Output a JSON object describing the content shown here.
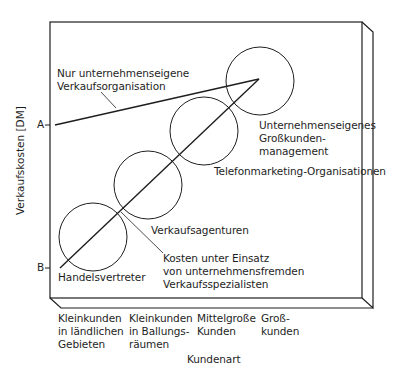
{
  "diagram": {
    "y_axis_label": "Verkaufskosten [DM]",
    "x_axis_label": "Kundenart",
    "y_markers": [
      {
        "label": "A",
        "y": 125
      },
      {
        "label": "B",
        "y": 268
      }
    ],
    "x_categories": [
      {
        "line1": "Kleinkunden",
        "line2": "in ländlichen",
        "line3": "Gebieten"
      },
      {
        "line1": "Kleinkunden",
        "line2": "in Ballungs-",
        "line3": "räumen"
      },
      {
        "line1": "Mittelgroße",
        "line2": "Kunden",
        "line3": ""
      },
      {
        "line1": "Groß-",
        "line2": "kunden",
        "line3": ""
      }
    ],
    "annotations": {
      "own_org": {
        "line1": "Nur unternehmenseigene",
        "line2": "Verkaufsorganisation"
      },
      "external": {
        "line1": "Kosten unter Einsatz",
        "line2": "von unternehmensfremden",
        "line3": "Verkaufsspezialisten"
      }
    },
    "circles": [
      {
        "label": "Handelsvertreter",
        "cx": 93,
        "cy": 237
      },
      {
        "label": "Verkaufsagenturen",
        "cx": 148,
        "cy": 185
      },
      {
        "label": "Telefonmarketing-Organisationen",
        "cx": 204,
        "cy": 131
      },
      {
        "label_line1": "Unternehmenseigenes",
        "label_line2": "Großkunden-",
        "label_line3": "management",
        "cx": 260,
        "cy": 81
      }
    ],
    "colors": {
      "ink": "#1e1e1e",
      "background": "#ffffff"
    }
  }
}
